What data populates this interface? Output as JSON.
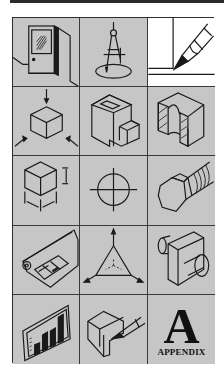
{
  "colors": {
    "cell_bg": "#c6c6c6",
    "cell_bg_highlight": "#ffffff",
    "line": "#1a1a1a",
    "grid": "#3a3a3a"
  },
  "grid": {
    "rows": 5,
    "columns": 3,
    "cells": [
      {
        "icon": "door-wall-icon"
      },
      {
        "icon": "compass-circle-icon"
      },
      {
        "icon": "pencil-drawing-icon",
        "highlighted": true
      },
      {
        "icon": "cube-projection-icon"
      },
      {
        "icon": "block-with-cutout-icon"
      },
      {
        "icon": "section-view-icon"
      },
      {
        "icon": "cube-dimension-icon"
      },
      {
        "icon": "circle-centerline-icon"
      },
      {
        "icon": "hex-bolt-icon"
      },
      {
        "icon": "blueprint-scroll-icon"
      },
      {
        "icon": "isometric-axes-icon"
      },
      {
        "icon": "cylinder-bracket-icon"
      },
      {
        "icon": "bar-chart-icon"
      },
      {
        "icon": "pencil-block-sketch-icon"
      },
      {
        "icon": "appendix-icon",
        "letter": "A",
        "label": "APPENDIX"
      }
    ]
  }
}
